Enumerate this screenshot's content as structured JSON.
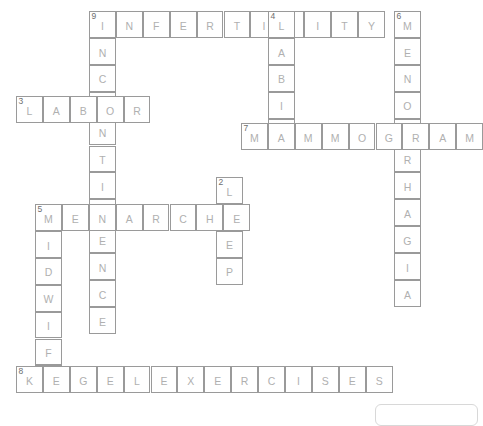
{
  "puzzle": {
    "title": "Women's Health Crossword Puzzle",
    "cell_size": 26.9,
    "colors": {
      "cell_border": "#9a9a9a",
      "letter": "#b0b0b0",
      "clue_number": "#6e6e6e",
      "background": "#ffffff",
      "footer_border": "#d8d8d8"
    },
    "entries": [
      {
        "number": "9",
        "direction": "across",
        "answer": "INFERTILITY",
        "x": 89,
        "y": 11,
        "letters": [
          "I",
          "N",
          "F",
          "E",
          "R",
          "T",
          "I",
          "L",
          "I",
          "T",
          "Y"
        ]
      },
      {
        "number": "9",
        "direction": "down",
        "answer": "INCONTINENCE",
        "x": 89,
        "y": 11,
        "letters": [
          "I",
          "N",
          "C",
          "O",
          "N",
          "T",
          "I",
          "N",
          "E",
          "N",
          "C",
          "E"
        ]
      },
      {
        "number": "4",
        "direction": "down",
        "answer": "LABIA",
        "x": 268,
        "y": 11,
        "letters": [
          "L",
          "A",
          "B",
          "I",
          "A"
        ]
      },
      {
        "number": "6",
        "direction": "down",
        "answer": "MENORRHAGIA",
        "x": 394,
        "y": 11,
        "letters": [
          "M",
          "E",
          "N",
          "O",
          "R",
          "R",
          "H",
          "A",
          "G",
          "I",
          "A"
        ]
      },
      {
        "number": "3",
        "direction": "across",
        "answer": "LABOR",
        "x": 16,
        "y": 96,
        "letters": [
          "L",
          "A",
          "B",
          "O",
          "R"
        ]
      },
      {
        "number": "7",
        "direction": "across",
        "answer": "MAMMOGRAM",
        "x": 241,
        "y": 123,
        "letters": [
          "M",
          "A",
          "M",
          "M",
          "O",
          "G",
          "R",
          "A",
          "M"
        ]
      },
      {
        "number": "2",
        "direction": "down",
        "answer": "LEEP",
        "x": 216,
        "y": 177,
        "letters": [
          "L",
          "E",
          "E",
          "P"
        ]
      },
      {
        "number": "5",
        "direction": "across",
        "answer": "MENARCHE",
        "x": 35,
        "y": 204,
        "letters": [
          "M",
          "E",
          "N",
          "A",
          "R",
          "C",
          "H",
          "E"
        ]
      },
      {
        "number": "5",
        "direction": "down",
        "answer": "MIDWIFE",
        "x": 35,
        "y": 204,
        "letters": [
          "M",
          "I",
          "D",
          "W",
          "I",
          "F",
          "E"
        ]
      },
      {
        "number": "8",
        "direction": "across",
        "answer": "KEGELEXERCISES",
        "x": 16,
        "y": 366,
        "letters": [
          "K",
          "E",
          "G",
          "E",
          "L",
          "E",
          "X",
          "E",
          "R",
          "C",
          "I",
          "S",
          "E",
          "S"
        ]
      }
    ]
  }
}
